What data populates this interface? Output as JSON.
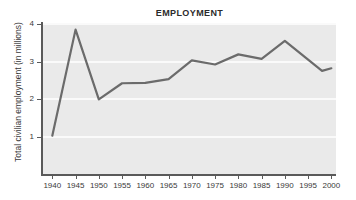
{
  "chart_data": {
    "type": "line",
    "title": "EMPLOYMENT",
    "xlabel": "",
    "ylabel": "Total civilian employment (in millions)",
    "xlim": [
      1938,
      2001
    ],
    "ylim": [
      0,
      4
    ],
    "xticks": [
      1940,
      1945,
      1950,
      1955,
      1960,
      1965,
      1970,
      1975,
      1980,
      1985,
      1990,
      1995,
      2000
    ],
    "xtick_labels": [
      "1940",
      "1945",
      "1950",
      "1955",
      "1960",
      "1965",
      "1970",
      "1975",
      "1980",
      "1985",
      "1990",
      "1995",
      "2000"
    ],
    "yticks": [
      1,
      2,
      3,
      4
    ],
    "ytick_labels": [
      "1",
      "2",
      "3",
      "4"
    ],
    "grid": "horizontal",
    "legend": "none",
    "series": [
      {
        "name": "Total civilian employment",
        "color": "#6b6b6b",
        "x": [
          1940,
          1945,
          1950,
          1955,
          1960,
          1965,
          1970,
          1975,
          1980,
          1985,
          1990,
          1998,
          2000
        ],
        "values": [
          1.02,
          3.85,
          1.99,
          2.42,
          2.43,
          2.53,
          3.03,
          2.92,
          3.19,
          3.07,
          3.55,
          2.75,
          2.82
        ]
      }
    ]
  },
  "style": {
    "plot_background": "#eaeaea",
    "gridline_color": "#fafafa",
    "axis_color": "#5a5a5a",
    "line_color": "#6b6b6b",
    "text_color": "#3a3a3a",
    "title_color": "#2b2b2b",
    "page_background": "#ffffff"
  }
}
